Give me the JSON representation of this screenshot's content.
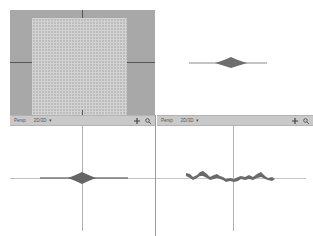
{
  "viewports": {
    "top_left": {
      "name": "Top",
      "background": "#a8a8a8",
      "grid_color": "#c4c4c4"
    },
    "top_right": {
      "name": "Perspective",
      "background": "#ffffff"
    },
    "bottom_left": {
      "name": "Front",
      "background": "#ffffff"
    },
    "bottom_right": {
      "name": "Side",
      "background": "#ffffff"
    }
  },
  "toolbars": [
    {
      "label": "Persp",
      "dropdown_value": "2D/3D",
      "dropdown_icon": "chevron-down-icon",
      "icons": [
        "move-icon",
        "zoom-icon"
      ]
    },
    {
      "label": "Persp",
      "dropdown_value": "2D/3D",
      "dropdown_icon": "chevron-down-icon",
      "icons": [
        "move-icon",
        "zoom-icon"
      ]
    }
  ],
  "colors": {
    "toolbar_bg": "#c9c9c9",
    "axis": "#8e8e8e",
    "shape_fill": "#707070"
  }
}
